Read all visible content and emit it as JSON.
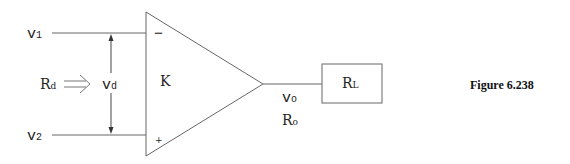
{
  "diagram": {
    "type": "op-amp equivalent circuit",
    "inputs": {
      "v1": {
        "main": "v",
        "sub": "1"
      },
      "v2": {
        "main": "v",
        "sub": "2"
      }
    },
    "differential_voltage": {
      "main": "v",
      "sub": "d"
    },
    "input_resistance": {
      "main": "R",
      "sub": "d"
    },
    "gain": "K",
    "inverting_sign": "−",
    "noninverting_sign": "+",
    "output_voltage": {
      "main": "v",
      "sub": "o"
    },
    "output_resistance": {
      "main": "R",
      "sub": "o"
    },
    "load": {
      "main": "R",
      "sub": "L"
    },
    "colors": {
      "stroke": "#555555",
      "text": "#222222"
    }
  },
  "caption": "Figure 6.238"
}
